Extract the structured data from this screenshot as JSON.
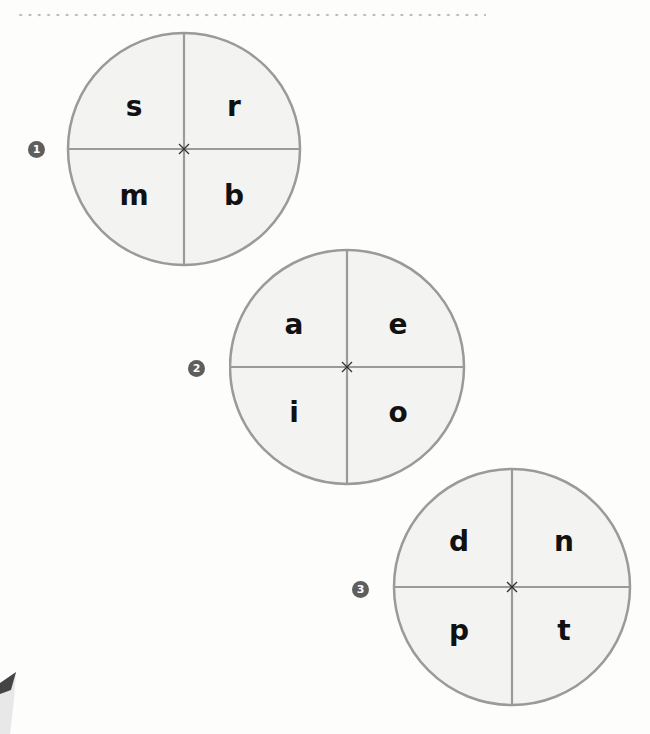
{
  "header": {
    "divider": "dotted-line"
  },
  "wheels": [
    {
      "number": "1",
      "letters": {
        "top_left": "s",
        "top_right": "r",
        "bottom_left": "m",
        "bottom_right": "b"
      }
    },
    {
      "number": "2",
      "letters": {
        "top_left": "a",
        "top_right": "e",
        "bottom_left": "i",
        "bottom_right": "o"
      }
    },
    {
      "number": "3",
      "letters": {
        "top_left": "d",
        "top_right": "n",
        "bottom_left": "p",
        "bottom_right": "t"
      }
    }
  ],
  "colors": {
    "circle_stroke": "#9a9a9a",
    "circle_fill": "#f3f3f2",
    "badge": "#5e5e5e",
    "letter": "#111111"
  },
  "decorations": {
    "pencil": "pencil-tip-icon",
    "center_mark": "cross-icon"
  }
}
